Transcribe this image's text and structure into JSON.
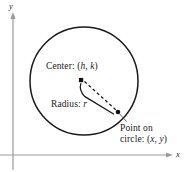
{
  "figure": {
    "name": "circle-definition-diagram",
    "background_color": "#ffffff",
    "stroke_color": "#1a1a1a",
    "axes": {
      "x_axis_label": "x",
      "y_axis_label": "y",
      "origin": {
        "x": 13,
        "y": 155
      },
      "x_axis_end": {
        "x": 172,
        "y": 155
      },
      "y_axis_end": {
        "x": 13,
        "y": 14
      },
      "axis_color": "#9a9a9a"
    },
    "circle": {
      "center_px": {
        "x": 84,
        "y": 81
      },
      "radius_px": 54,
      "stroke_width": 1.4
    },
    "center_point": {
      "label": "Center: (h, k)",
      "label_static": "Center: (",
      "var_h": "h",
      "separator": ", ",
      "var_k": "k",
      "label_close": ")",
      "dot_px": {
        "x": 81,
        "y": 80
      }
    },
    "radius": {
      "label_static": "Radius: ",
      "var_r": "r",
      "dash_pattern": "3,2.6"
    },
    "boundary_point": {
      "line1": "Point on",
      "line2_static": "circle: (",
      "var_x": "x",
      "separator": ", ",
      "var_y": "y",
      "line2_close": ")",
      "dot_px": {
        "x": 118,
        "y": 112
      }
    }
  }
}
